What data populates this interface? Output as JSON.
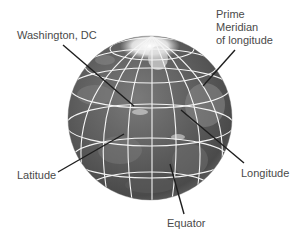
{
  "diagram": {
    "colors": {
      "background": "#ffffff",
      "globe_dark": "#4a4a4a",
      "globe_mid": "#6e6e6e",
      "globe_light": "#9a9a9a",
      "ice_cap": "#f2f2f2",
      "grid_lines": "#f4f4f4",
      "leader_lines": "#1e1e1e",
      "label_text": "#4a4a4a"
    },
    "labels": {
      "washington": "Washington, DC",
      "prime_meridian": [
        "Prime",
        "Meridian",
        "of longitude"
      ],
      "latitude": "Latitude",
      "longitude": "Longitude",
      "equator": "Equator"
    }
  }
}
